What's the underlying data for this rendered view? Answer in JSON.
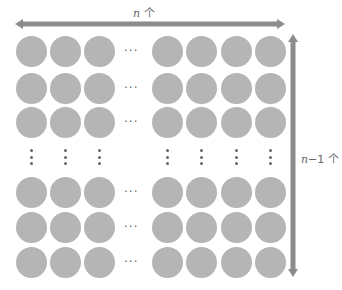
{
  "diagram": {
    "colors": {
      "circle": "#b5b5b5",
      "arrow": "#8c8c8c",
      "dots": "#666666",
      "label": "#666666"
    },
    "top_label": {
      "var": "n",
      "suffix": " 个"
    },
    "side_label": {
      "var": "n",
      "suffix": "−1 个"
    },
    "columns_x": [
      31,
      65,
      99,
      167,
      201,
      236,
      270
    ],
    "rows_y": [
      51,
      88,
      122,
      192,
      227,
      262
    ],
    "hdots_x": 133,
    "vdots_y": 157,
    "horizontal_arrow": {
      "x1": 15,
      "x2": 285,
      "y": 24
    },
    "vertical_arrow": {
      "x": 293,
      "y1": 34,
      "y2": 277
    },
    "ellipsis_text": "···"
  }
}
